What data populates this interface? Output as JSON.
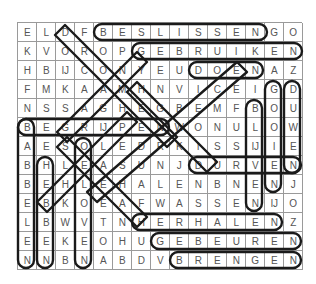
{
  "puzzle": {
    "type": "word-search",
    "columns": 15,
    "rows": 13,
    "grid": [
      [
        "E",
        "L",
        "D",
        "F",
        "B",
        "E",
        "S",
        "L",
        "I",
        "S",
        "S",
        "E",
        "N",
        "G",
        "O"
      ],
      [
        "K",
        "V",
        "O",
        "R",
        "O",
        "P",
        "G",
        "E",
        "B",
        "R",
        "U",
        "I",
        "K",
        "E",
        "N"
      ],
      [
        "H",
        "B",
        "IJ",
        "C",
        "O",
        "N",
        "Y",
        "E",
        "U",
        "D",
        "O",
        "E",
        "N",
        "A",
        "Z"
      ],
      [
        "F",
        "M",
        "K",
        "A",
        "A",
        "M",
        "H",
        "N",
        "V",
        "I",
        "C",
        "E",
        "I",
        "G",
        "D"
      ],
      [
        "N",
        "S",
        "S",
        "A",
        "G",
        "H",
        "E",
        "G",
        "B",
        "E",
        "M",
        "F",
        "B",
        "O",
        "U"
      ],
      [
        "B",
        "E",
        "G",
        "R",
        "IJ",
        "P",
        "E",
        "N",
        "W",
        "O",
        "N",
        "U",
        "L",
        "O",
        "W"
      ],
      [
        "A",
        "E",
        "S",
        "O",
        "L",
        "E",
        "D",
        "R",
        "K",
        "I",
        "S",
        "S",
        "IJ",
        "I",
        "E"
      ],
      [
        "B",
        "H",
        "L",
        "E",
        "A",
        "S",
        "U",
        "N",
        "J",
        "D",
        "U",
        "R",
        "V",
        "E",
        "N"
      ],
      [
        "B",
        "E",
        "H",
        "L",
        "E",
        "H",
        "A",
        "L",
        "E",
        "N",
        "B",
        "N",
        "E",
        "N",
        "J"
      ],
      [
        "E",
        "B",
        "K",
        "O",
        "E",
        "A",
        "F",
        "W",
        "A",
        "S",
        "S",
        "E",
        "N",
        "IJ",
        "O"
      ],
      [
        "L",
        "B",
        "W",
        "V",
        "T",
        "N",
        "H",
        "E",
        "R",
        "H",
        "A",
        "L",
        "E",
        "N",
        "Z"
      ],
      [
        "E",
        "E",
        "K",
        "E",
        "O",
        "H",
        "U",
        "G",
        "E",
        "B",
        "E",
        "U",
        "R",
        "E",
        "N"
      ],
      [
        "N",
        "N",
        "B",
        "N",
        "A",
        "B",
        "D",
        "V",
        "B",
        "R",
        "E",
        "N",
        "G",
        "E",
        "N"
      ]
    ],
    "found_words": [
      {
        "word": "BESLISSEN",
        "row": 1,
        "col": 5,
        "dir": "right",
        "length": 9
      },
      {
        "word": "GEBRUIKEN",
        "row": 2,
        "col": 7,
        "dir": "right",
        "length": 9
      },
      {
        "word": "DOEN",
        "row": 3,
        "col": 10,
        "dir": "right",
        "length": 4
      },
      {
        "word": "BEGRIJPEN",
        "row": 6,
        "col": 1,
        "dir": "right",
        "length": 8
      },
      {
        "word": "DURVEN",
        "row": 8,
        "col": 10,
        "dir": "right",
        "length": 6
      },
      {
        "word": "HALEN",
        "row": 9,
        "col": 6,
        "dir": "right",
        "length": 5
      },
      {
        "word": "WASSEN",
        "row": 10,
        "col": 8,
        "dir": "right",
        "length": 6
      },
      {
        "word": "HERHALEN",
        "row": 11,
        "col": 7,
        "dir": "right",
        "length": 8
      },
      {
        "word": "GEBEUREN",
        "row": 12,
        "col": 8,
        "dir": "right",
        "length": 8
      },
      {
        "word": "BRENGEN",
        "row": 13,
        "col": 9,
        "dir": "right",
        "length": 7
      },
      {
        "word": "BABBELEN",
        "row": 6,
        "col": 1,
        "dir": "down",
        "length": 8
      },
      {
        "word": "HEBBEN",
        "row": 8,
        "col": 2,
        "dir": "down",
        "length": 6
      },
      {
        "word": "GOOIEN",
        "row": 4,
        "col": 14,
        "dir": "down",
        "length": 6
      },
      {
        "word": "DUWEN",
        "row": 4,
        "col": 15,
        "dir": "down",
        "length": 5
      },
      {
        "word": "BLIJVEN",
        "row": 5,
        "col": 13,
        "dir": "down",
        "length": 6
      },
      {
        "word": "VOLGEN",
        "row": 9,
        "col": 12,
        "dir": "down",
        "length": 2
      }
    ]
  }
}
